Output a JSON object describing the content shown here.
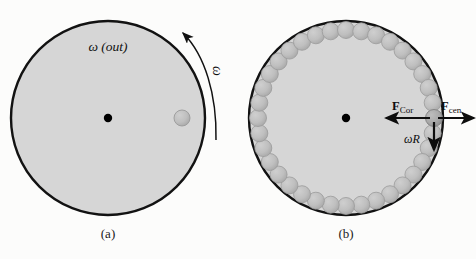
{
  "figure": {
    "width": 476,
    "height": 259,
    "background_color": "#fcfcfb",
    "disk_fill_color": "#d6d6d6",
    "disk_stroke_color": "#121212",
    "ball_fill_color": "#bdbdbd",
    "ball_stroke_color": "#9a9a9a",
    "highlight_ball_fill_color": "#a9a9a9",
    "center_dot_color": "#000000",
    "arrow_color": "#0d0d0d"
  },
  "panel_a": {
    "caption": "(a)",
    "center": {
      "x": 108,
      "y": 118
    },
    "radius": 97,
    "omega_out_label": "ω (out)",
    "omega_curve_label": "ω",
    "rotation_direction": "counterclockwise",
    "ball": {
      "x": 182,
      "y": 118,
      "r": 8
    }
  },
  "panel_b": {
    "caption": "(b)",
    "center": {
      "x": 346,
      "y": 118
    },
    "radius": 97,
    "ball_ring": {
      "count": 36,
      "ring_radius": 88,
      "ball_radius": 8.5
    },
    "highlight_ball": {
      "x": 434,
      "y": 118,
      "r": 8.5
    },
    "forces": [
      {
        "name": "coriolis-force",
        "label_main": "F",
        "label_sub": "Cor",
        "direction": "left",
        "from": {
          "x": 426,
          "y": 118
        },
        "to": {
          "x": 386,
          "y": 118
        },
        "label_pos": {
          "x": 392,
          "y": 108
        }
      },
      {
        "name": "centrifugal-force",
        "label_main": "F",
        "label_sub": "cen",
        "direction": "right",
        "from": {
          "x": 442,
          "y": 118
        },
        "to": {
          "x": 474,
          "y": 118
        },
        "label_pos": {
          "x": 441,
          "y": 108
        }
      },
      {
        "name": "tangential-velocity",
        "label_main": "ωR",
        "label_sub": "",
        "direction": "down",
        "from": {
          "x": 434,
          "y": 122
        },
        "to": {
          "x": 434,
          "y": 150
        },
        "label_pos": {
          "x": 404,
          "y": 141
        }
      }
    ]
  }
}
